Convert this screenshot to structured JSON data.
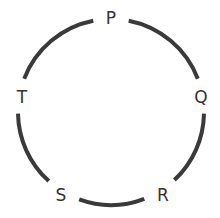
{
  "diagram": {
    "type": "circular-arrangement",
    "center": [
      111,
      112
    ],
    "radius": 93,
    "stroke_color": "#3a3a3a",
    "label_color": "#333333",
    "nodes": [
      {
        "label": "P",
        "x": 111,
        "y": 18,
        "angle": -90
      },
      {
        "label": "Q",
        "x": 201,
        "y": 97,
        "angle": -10
      },
      {
        "label": "R",
        "x": 163,
        "y": 195,
        "angle": 58
      },
      {
        "label": "S",
        "x": 61,
        "y": 195,
        "angle": 121
      },
      {
        "label": "T",
        "x": 22,
        "y": 97,
        "angle": 190
      }
    ]
  }
}
